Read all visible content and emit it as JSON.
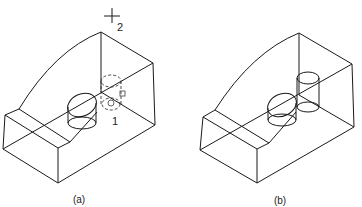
{
  "figure": {
    "panels": [
      {
        "id": "a",
        "caption": "(a)",
        "callouts": [
          {
            "text": "2",
            "marker": "crosshair-cursor"
          },
          {
            "text": "1",
            "marker": "grip-point"
          }
        ],
        "description": "Wireframe block with cylinder; second cylinder being copied shown as dashed preview"
      },
      {
        "id": "b",
        "caption": "(b)",
        "callouts": [],
        "description": "Wireframe block with two cylinders after copy"
      }
    ],
    "colors": {
      "line": "#1a1a1a",
      "background": "#ffffff"
    }
  }
}
